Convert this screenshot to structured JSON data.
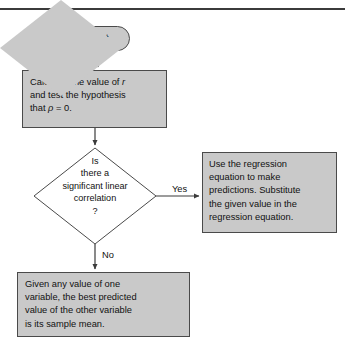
{
  "figure": {
    "type": "flowchart",
    "top_rule": true
  },
  "style": {
    "node_fill": "#c9c9c9",
    "node_border": "#4a4a4a",
    "text_color": "#111111",
    "background": "#ffffff",
    "rule_color": "#3b3b3b"
  },
  "nodes": {
    "start": {
      "shape": "terminator",
      "label": "Start"
    },
    "calculate": {
      "shape": "process",
      "label": "Calculate the value of r\nand test the hypothesis\nthat ρ = 0."
    },
    "decision": {
      "shape": "decision",
      "label": "Is\nthere a\nsignificant linear\ncorrelation\n?"
    },
    "regression": {
      "shape": "process",
      "label": "Use the regression\nequation to make\npredictions. Substitute\nthe given value in the\nregression equation."
    },
    "sample_mean": {
      "shape": "process",
      "label": "Given any value of one\nvariable, the best predicted\nvalue of the other variable\nis its sample mean."
    }
  },
  "edges": {
    "yes_label": "Yes",
    "no_label": "No",
    "start_to_calculate": "",
    "calculate_to_decision": "",
    "decision_to_regression": "Yes",
    "decision_to_sample_mean": "No"
  }
}
